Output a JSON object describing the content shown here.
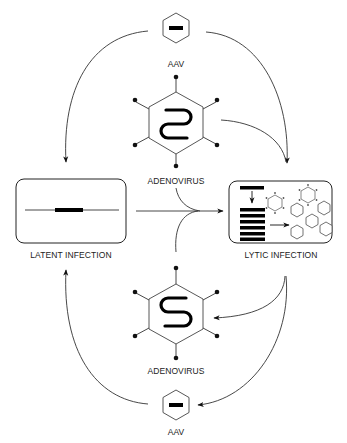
{
  "diagram": {
    "nodes": {
      "aav_top": {
        "label": "AAV"
      },
      "adenovirus_top": {
        "label": "ADENOVIRUS"
      },
      "latent": {
        "label": "LATENT INFECTION"
      },
      "lytic": {
        "label": "LYTIC INFECTION"
      },
      "adenovirus_bottom": {
        "label": "ADENOVIRUS"
      },
      "aav_bottom": {
        "label": "AAV"
      }
    },
    "edges": [
      {
        "from": "AAV (top)",
        "to": "LATENT INFECTION"
      },
      {
        "from": "AAV (top)",
        "to": "LYTIC INFECTION"
      },
      {
        "from": "ADENOVIRUS (top)",
        "to": "LYTIC INFECTION"
      },
      {
        "from": "LATENT INFECTION",
        "to": "LYTIC INFECTION",
        "joined_by": "ADENOVIRUS (top and bottom)"
      },
      {
        "from": "LYTIC INFECTION",
        "to": "ADENOVIRUS (bottom)"
      },
      {
        "from": "LYTIC INFECTION",
        "to": "AAV (bottom)"
      },
      {
        "from": "AAV (bottom)",
        "to": "LATENT INFECTION"
      }
    ],
    "colors": {
      "line": "#333333",
      "fill": "#000000",
      "background": "#ffffff"
    }
  }
}
